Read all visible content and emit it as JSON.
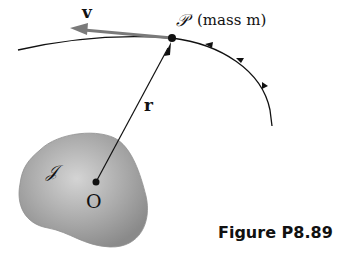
{
  "figure": {
    "caption": "Figure P8.89",
    "labels": {
      "velocity": "v",
      "particle_symbol": "𝒫",
      "particle_desc": "(mass m)",
      "position_vector": "r",
      "body": "𝒥",
      "origin": "O"
    },
    "colors": {
      "stroke": "#111111",
      "velocity_arrow": "#7a7a7a",
      "body_fill": "#9a9a9a",
      "body_highlight": "#cfcfcf"
    }
  }
}
